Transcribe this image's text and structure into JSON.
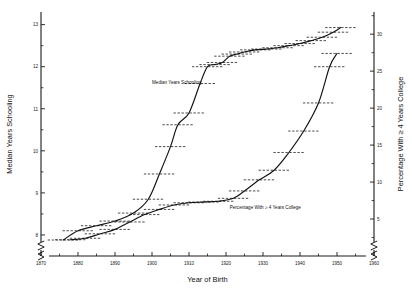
{
  "chart_data": {
    "type": "line",
    "title": "",
    "xlabel": "Year of Birth",
    "ylabel": "Median Years Schooling",
    "y2label": "Percentage With ≥ 4 Years College",
    "xlim": [
      1870,
      1960
    ],
    "xticks": [
      1870,
      1880,
      1890,
      1900,
      1910,
      1920,
      1930,
      1940,
      1950,
      1960
    ],
    "xtick_labels": [
      "1870",
      "1880",
      "1890",
      "1900",
      "1910",
      "1920",
      "1930",
      "1940",
      "1950",
      "1960"
    ],
    "xminor_step": 5,
    "ylim": [
      7.5,
      13.3
    ],
    "yticks": [
      8,
      9,
      10,
      11,
      12,
      13
    ],
    "ytick_labels": [
      "8",
      "9",
      "10",
      "11",
      "12",
      "13"
    ],
    "yminor_step": 0.5,
    "y2lim": [
      0.0,
      33.0
    ],
    "y2ticks": [
      5,
      10,
      15,
      20,
      25,
      30
    ],
    "y2tick_labels": [
      "5",
      "10",
      "15",
      "20",
      "25",
      "30"
    ],
    "y2minor_step": 2.5,
    "axis_break_left": true,
    "axis_break_right": true,
    "axis_break_x_left": true,
    "axis_break_x_right": true,
    "grid": false,
    "legend_position": "inline-annotation",
    "series": [
      {
        "name": "Median Years Schooling",
        "axis": "left",
        "label_x": 1900.0,
        "label_y": 11.58,
        "x": [
          1876,
          1880,
          1885,
          1890,
          1895,
          1899,
          1902,
          1905,
          1907,
          1910,
          1913,
          1915,
          1917,
          1919,
          1921,
          1923,
          1925,
          1928,
          1931,
          1934,
          1937,
          1940,
          1943,
          1946,
          1949,
          1951
        ],
        "y": [
          7.88,
          8.1,
          8.22,
          8.33,
          8.52,
          8.85,
          9.45,
          10.1,
          10.62,
          10.9,
          11.6,
          12.0,
          12.05,
          12.1,
          12.25,
          12.3,
          12.35,
          12.4,
          12.42,
          12.45,
          12.5,
          12.55,
          12.62,
          12.7,
          12.82,
          12.93
        ],
        "marker_half_width_years": 4.2,
        "marker_style": "horizontal-dashed-interval"
      },
      {
        "name": "Percentage With ≥ 4 Years College",
        "axis": "right",
        "label_x": 1921.0,
        "label_y_right": 6.4,
        "x": [
          1878,
          1882,
          1886,
          1890,
          1894,
          1898,
          1902,
          1906,
          1910,
          1914,
          1918,
          1922,
          1925,
          1929,
          1933,
          1937,
          1941,
          1945,
          1948,
          1950
        ],
        "y": [
          2.2,
          2.4,
          3.0,
          3.6,
          4.6,
          5.6,
          6.3,
          6.9,
          7.2,
          7.3,
          7.4,
          7.8,
          8.8,
          10.3,
          11.6,
          14.0,
          16.9,
          20.7,
          25.6,
          27.4
        ],
        "marker_half_width_years": 4.2,
        "marker_style": "horizontal-dashed-interval"
      }
    ]
  }
}
